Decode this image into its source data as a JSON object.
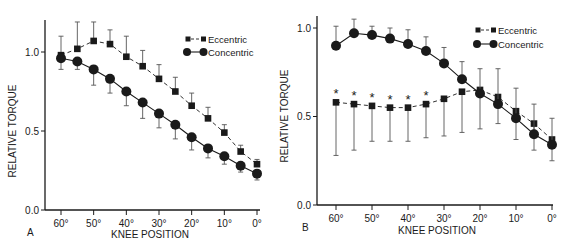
{
  "chart_data": [
    {
      "panel": "A",
      "type": "line",
      "xlabel": "KNEE POSITION",
      "ylabel": "RELATIVE TORQUE",
      "x": [
        60,
        55,
        50,
        45,
        40,
        35,
        30,
        25,
        20,
        15,
        10,
        5,
        0
      ],
      "xticks": [
        "60°",
        "50°",
        "40°",
        "30°",
        "20°",
        "10°",
        "0°"
      ],
      "yticks": [
        "0.0",
        "0.5",
        "1.0"
      ],
      "ylim": [
        0,
        1.2
      ],
      "grid": false,
      "legend_position": "upper right",
      "series": [
        {
          "name": "Eccentric",
          "marker": "square",
          "line": "dashed",
          "values": [
            0.98,
            1.02,
            1.07,
            1.05,
            0.97,
            0.91,
            0.83,
            0.75,
            0.66,
            0.58,
            0.49,
            0.37,
            0.29
          ],
          "err_up": [
            0.12,
            0.17,
            0.12,
            0.09,
            0.13,
            0.1,
            0.09,
            0.09,
            0.08,
            0.07,
            0.05,
            0.04,
            0.03
          ]
        },
        {
          "name": "Concentric",
          "marker": "circle",
          "line": "solid",
          "values": [
            0.96,
            0.94,
            0.89,
            0.83,
            0.75,
            0.68,
            0.61,
            0.54,
            0.46,
            0.39,
            0.34,
            0.28,
            0.23
          ],
          "err_down": [
            0.07,
            0.05,
            0.1,
            0.09,
            0.09,
            0.1,
            0.09,
            0.09,
            0.08,
            0.06,
            0.05,
            0.04,
            0.04
          ]
        }
      ]
    },
    {
      "panel": "B",
      "type": "line",
      "xlabel": "KNEE POSITION",
      "ylabel": "RELATIVE TORQUE",
      "x": [
        60,
        55,
        50,
        45,
        40,
        35,
        30,
        25,
        20,
        15,
        10,
        5,
        0
      ],
      "xticks": [
        "60°",
        "50°",
        "40°",
        "30°",
        "20°",
        "10°",
        "0°"
      ],
      "yticks": [
        "0.0",
        "0.5",
        "1.0"
      ],
      "ylim": [
        0,
        1.05
      ],
      "grid": false,
      "legend_position": "upper right",
      "annotations": [
        "* at 60°, 55°, 50°, 45°, 40°, 35° (Eccentric)"
      ],
      "series": [
        {
          "name": "Eccentric",
          "marker": "square",
          "line": "dashed",
          "values": [
            0.58,
            0.57,
            0.56,
            0.55,
            0.55,
            0.57,
            0.6,
            0.64,
            0.65,
            0.61,
            0.53,
            0.46,
            0.37
          ],
          "err_down": [
            0.3,
            0.26,
            0.2,
            0.19,
            0.19,
            0.19,
            0.21,
            0.23,
            0.22,
            0.15,
            0.16,
            0.15,
            0.12
          ]
        },
        {
          "name": "Concentric",
          "marker": "circle",
          "line": "solid",
          "values": [
            0.9,
            0.97,
            0.96,
            0.94,
            0.91,
            0.87,
            0.8,
            0.71,
            0.63,
            0.57,
            0.49,
            0.4,
            0.34
          ],
          "err_up": [
            0.11,
            0.08,
            0.05,
            0.06,
            0.08,
            0.08,
            0.09,
            0.1,
            0.14,
            0.2,
            0.17,
            0.17,
            0.15
          ]
        }
      ]
    }
  ],
  "panels": {
    "a": {
      "letter": "A",
      "xlabel": "KNEE POSITION",
      "ylabel": "RELATIVE TORQUE",
      "legend_ecc": "Eccentric",
      "legend_con": "Concentric"
    },
    "b": {
      "letter": "B",
      "xlabel": "KNEE POSITION",
      "ylabel": "RELATIVE TORQUE",
      "legend_ecc": "Eccentric",
      "legend_con": "Concentric"
    }
  },
  "colors": {
    "ink": "#1a1a1a",
    "background": "#ffffff"
  }
}
